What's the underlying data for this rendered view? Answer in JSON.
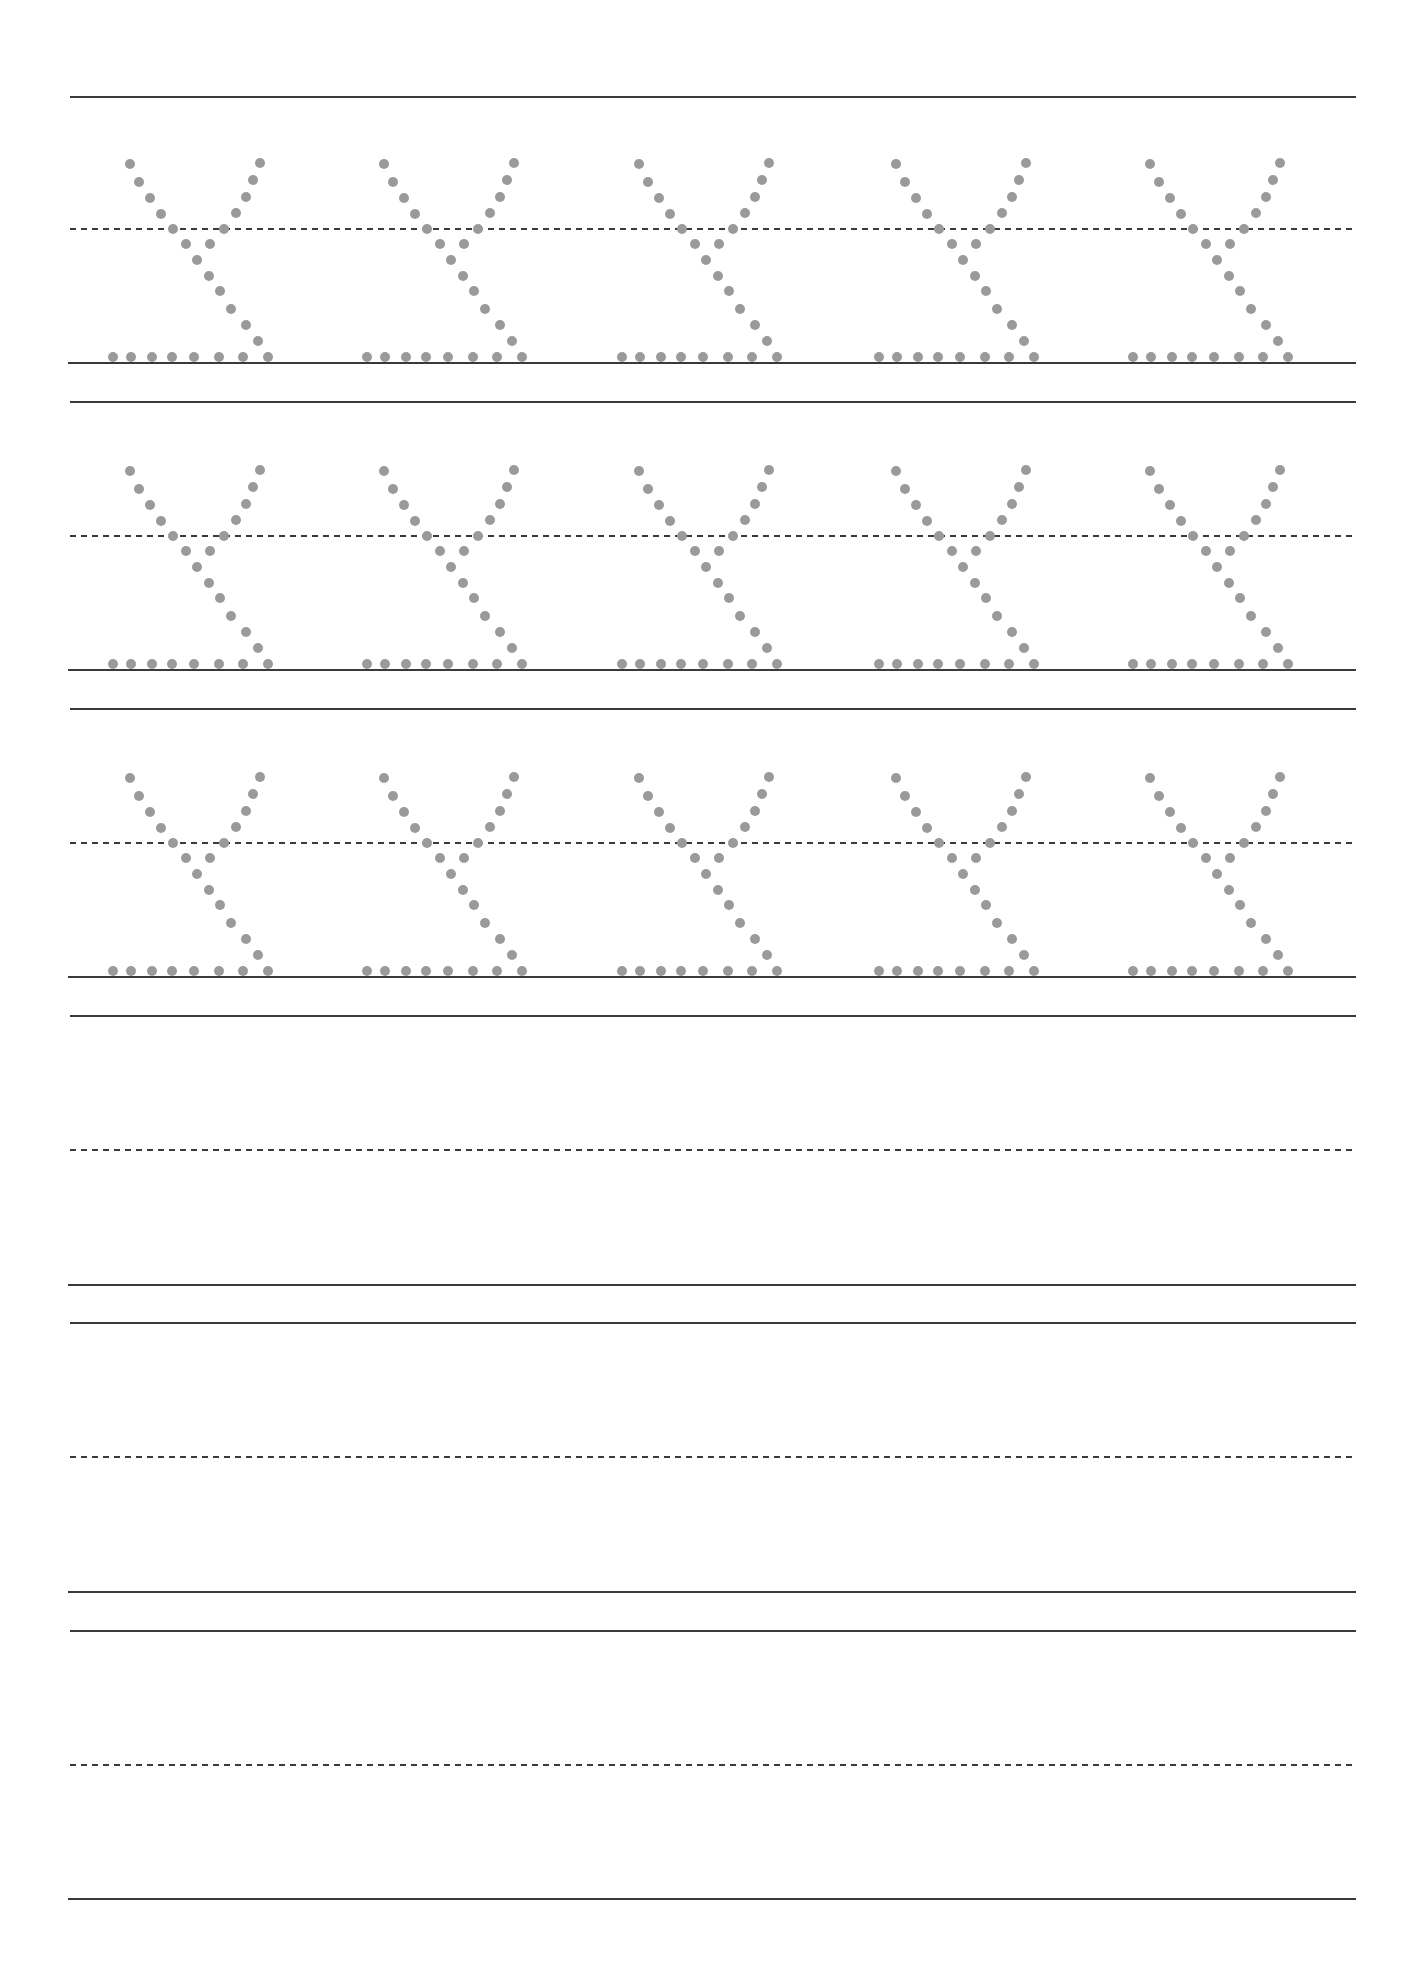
{
  "worksheet": {
    "type": "handwriting-practice",
    "letter": "y",
    "colors": {
      "line": "#3a3a3a",
      "dot": "#9a9a9a",
      "background": "#ffffff"
    },
    "line_x_start": 70,
    "line_x_end": 1356,
    "rows": [
      {
        "top": 97,
        "mid": 229,
        "base": 363,
        "traced": true
      },
      {
        "top": 402,
        "mid": 536,
        "base": 670,
        "traced": true
      },
      {
        "top": 709,
        "mid": 843,
        "base": 977,
        "traced": true
      },
      {
        "top": 1016,
        "mid": 1150,
        "base": 1285,
        "traced": false
      },
      {
        "top": 1323,
        "mid": 1457,
        "base": 1592,
        "traced": false
      },
      {
        "top": 1631,
        "mid": 1765,
        "base": 1899,
        "traced": false
      }
    ],
    "letter_origins_x": [
      108,
      362,
      617,
      874,
      1128
    ],
    "dot_radius": 5,
    "letter_dots": [
      [
        22,
        -199
      ],
      [
        31,
        -181
      ],
      [
        42,
        -165
      ],
      [
        53,
        -149
      ],
      [
        65,
        -134
      ],
      [
        152,
        -200
      ],
      [
        145,
        -183
      ],
      [
        138,
        -166
      ],
      [
        128,
        -150
      ],
      [
        116,
        -134
      ],
      [
        78,
        -119
      ],
      [
        102,
        -119
      ],
      [
        89,
        -103
      ],
      [
        101,
        -87
      ],
      [
        112,
        -72
      ],
      [
        123,
        -54
      ],
      [
        138,
        -38
      ],
      [
        150,
        -22
      ],
      [
        5,
        -6
      ],
      [
        23,
        -6
      ],
      [
        44,
        -6
      ],
      [
        64,
        -6
      ],
      [
        86,
        -6
      ],
      [
        111,
        -6
      ],
      [
        135,
        -6
      ],
      [
        160,
        -6
      ]
    ]
  }
}
